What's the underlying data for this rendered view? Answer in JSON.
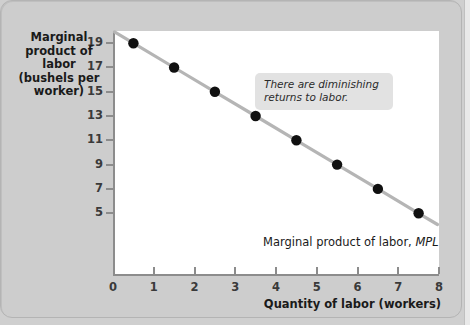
{
  "chart_data": {
    "type": "scatter",
    "title": "",
    "xlabel": "Quantity of labor (workers)",
    "ylabel": "Marginal product of labor (bushels per worker)",
    "ylabel_lines": [
      "Marginal",
      "product of labor",
      "(bushels per",
      "worker)"
    ],
    "xlim": [
      0,
      8
    ],
    "ylim": [
      0,
      20
    ],
    "grid": false,
    "legend": "none",
    "x": [
      0.5,
      1.5,
      2.5,
      3.5,
      4.5,
      5.5,
      6.5,
      7.5
    ],
    "values": [
      19,
      17,
      15,
      13,
      11,
      9,
      7,
      5
    ],
    "series": [
      {
        "name": "Marginal product of labor, MPL",
        "x": [
          0.5,
          1.5,
          2.5,
          3.5,
          4.5,
          5.5,
          6.5,
          7.5
        ],
        "values": [
          19,
          17,
          15,
          13,
          11,
          9,
          7,
          5
        ],
        "line_color": "#b5b5b5",
        "marker_color": "#101010"
      }
    ],
    "xticks": [
      0,
      1,
      2,
      3,
      4,
      5,
      6,
      7,
      8
    ],
    "xticklabels": [
      "0",
      "1",
      "2",
      "3",
      "4",
      "5",
      "6",
      "7",
      "8"
    ],
    "yticks": [
      5,
      7,
      9,
      11,
      13,
      15,
      17,
      19
    ],
    "yticklabels": [
      "19",
      "17",
      "15",
      "13",
      "11",
      "9",
      "7",
      "5"
    ],
    "annotations": [
      {
        "text": "There are diminishing returns to labor.",
        "style": "italic",
        "background": "#e2e2e2"
      }
    ],
    "series_label": {
      "prefix": "Marginal product of labor, ",
      "emphasis": "MPL"
    }
  },
  "colors": {
    "page_background": "#cfcfcf",
    "card_background": "#cdcdcd",
    "plot_background": "#ffffff",
    "axis": "#8c8c8c",
    "line": "#b5b5b5",
    "marker": "#101010",
    "text": "#1a1a1a",
    "callout_background": "#e2e2e2"
  }
}
